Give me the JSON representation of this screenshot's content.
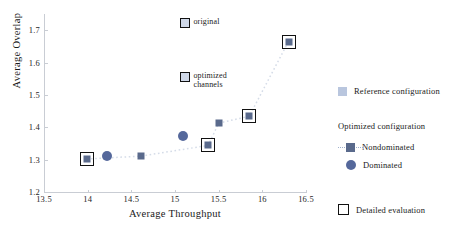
{
  "chart_data": {
    "type": "scatter",
    "title": "",
    "xlabel": "Average Throughput",
    "ylabel": "Average Overlap",
    "xlim": [
      13.5,
      16.5
    ],
    "ylim": [
      1.2,
      1.75
    ],
    "xticks": [
      "13.5",
      "14",
      "14.5",
      "15",
      "15.5",
      "16",
      "16.5"
    ],
    "xtick_values": [
      13.5,
      14,
      14.5,
      15,
      15.5,
      16,
      16.5
    ],
    "yticks": [
      "1.2",
      "1.3",
      "1.4",
      "1.5",
      "1.6",
      "1.7"
    ],
    "ytick_values": [
      1.2,
      1.3,
      1.4,
      1.5,
      1.6,
      1.7
    ],
    "grid": false,
    "legend_position": "right",
    "series": [
      {
        "name": "Optimized configuration - Nondominated",
        "marker": "square",
        "color": "#5a6a8c",
        "connected": true,
        "points": [
          {
            "x": 13.99,
            "y": 1.302,
            "detailed": true
          },
          {
            "x": 14.61,
            "y": 1.311,
            "detailed": false
          },
          {
            "x": 15.38,
            "y": 1.344,
            "detailed": true
          },
          {
            "x": 15.5,
            "y": 1.413,
            "detailed": false
          },
          {
            "x": 15.85,
            "y": 1.434,
            "detailed": true
          },
          {
            "x": 16.3,
            "y": 1.665,
            "detailed": true
          }
        ]
      },
      {
        "name": "Optimized configuration - Dominated",
        "marker": "circle",
        "color": "#55689b",
        "connected": false,
        "points": [
          {
            "x": 14.22,
            "y": 1.311,
            "detailed": false
          },
          {
            "x": 15.09,
            "y": 1.373,
            "detailed": false
          }
        ]
      },
      {
        "name": "Reference configuration",
        "marker": "square",
        "color": "#b9c6de",
        "connected": false,
        "points": []
      }
    ],
    "annotations": [
      {
        "label": "original",
        "x": 15.12,
        "y": 1.722,
        "marker": "detailed-square"
      },
      {
        "label": "optimized\nchannels",
        "x": 15.12,
        "y": 1.555,
        "marker": "detailed-square"
      }
    ]
  },
  "legend": {
    "reference_label": "Reference configuration",
    "optimized_header": "Optimized configuration",
    "nondominated_label": "Nondominated",
    "dominated_label": "Dominated",
    "detailed_label": "Detailed evaluation"
  },
  "colors": {
    "reference": "#b9c6de",
    "nondominated": "#5a6a8c",
    "dominated": "#55689b",
    "detailed_outline": "#111111",
    "axis": "#c9cdd4",
    "connector": "#d5dce8"
  }
}
